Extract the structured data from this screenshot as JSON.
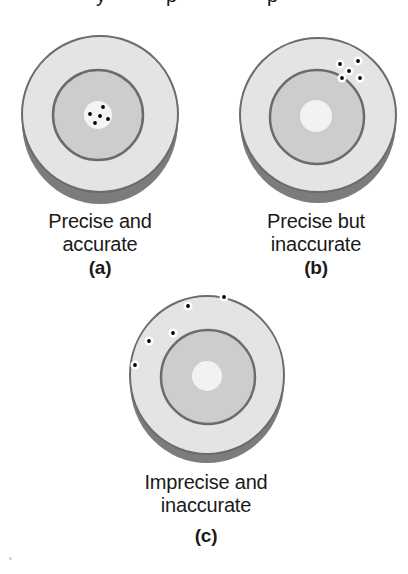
{
  "figure": {
    "top_cutoff_text": "accuracy and precision",
    "colors": {
      "outer_face": "#e4e4e4",
      "inner_zone": "#cdcdcd",
      "bullseye": "#f2f2f2",
      "ring_line": "#6b6b6b",
      "shadow": "#7c7c7c",
      "hit": "#000000",
      "hit_halo": "#ffffff"
    },
    "panels": [
      {
        "id": "a",
        "line1": "Precise and",
        "line2": "accurate",
        "tag": "(a)",
        "hits": [
          [
            103,
            107
          ],
          [
            90,
            114
          ],
          [
            100,
            116
          ],
          [
            108,
            119
          ],
          [
            95,
            123
          ]
        ]
      },
      {
        "id": "b",
        "line1": "Precise but",
        "line2": "inaccurate",
        "tag": "(b)",
        "hits": [
          [
            340,
            64
          ],
          [
            358,
            61
          ],
          [
            349,
            71
          ],
          [
            342,
            78
          ],
          [
            360,
            78
          ]
        ]
      },
      {
        "id": "c",
        "line1": "Imprecise and",
        "line2": "inaccurate",
        "tag": "(c)",
        "hits": [
          [
            224,
            297
          ],
          [
            188,
            306
          ],
          [
            173,
            333
          ],
          [
            149,
            341
          ],
          [
            135,
            365
          ]
        ]
      }
    ]
  }
}
